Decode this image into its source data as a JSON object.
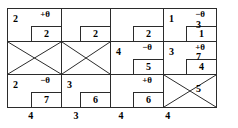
{
  "tableau": {
    "title": "transportation-simplex-tableau",
    "rows": [
      {
        "supply": "3",
        "cells": [
          {
            "cost": "2",
            "theta": "+θ",
            "allocation": "2",
            "crossed": false
          },
          {
            "cost": "",
            "theta": "",
            "allocation": "2",
            "crossed": false
          },
          {
            "cost": "",
            "theta": "",
            "allocation": "2",
            "crossed": false
          },
          {
            "cost": "1",
            "theta": "−θ",
            "allocation": "1",
            "crossed": false
          }
        ]
      },
      {
        "supply": "7",
        "cells": [
          {
            "cost": "",
            "theta": "",
            "allocation": "",
            "crossed": true
          },
          {
            "cost": "",
            "theta": "",
            "allocation": "",
            "crossed": true
          },
          {
            "cost": "4",
            "theta": "−θ",
            "allocation": "5",
            "crossed": false
          },
          {
            "cost": "3",
            "theta": "+θ",
            "allocation": "4",
            "crossed": false
          }
        ]
      },
      {
        "supply": "5",
        "cells": [
          {
            "cost": "2",
            "theta": "−θ",
            "allocation": "7",
            "crossed": false
          },
          {
            "cost": "3",
            "theta": "",
            "allocation": "6",
            "crossed": false
          },
          {
            "cost": "",
            "theta": "+θ",
            "allocation": "6",
            "crossed": false
          },
          {
            "cost": "",
            "theta": "",
            "allocation": "",
            "crossed": true
          }
        ]
      }
    ],
    "demands": [
      "4",
      "3",
      "4",
      "4"
    ]
  }
}
